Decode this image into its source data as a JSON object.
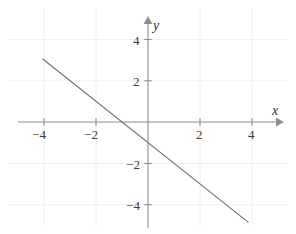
{
  "chart_data": {
    "type": "line",
    "title": "",
    "xlabel": "x",
    "ylabel": "y",
    "xlim": [
      -5.2,
      5.2
    ],
    "ylim": [
      -5.4,
      5.2
    ],
    "grid": true,
    "grid_style": "faint",
    "legend": "none",
    "background_color": "#ffffff",
    "axis_color": "#8c8c8c",
    "line_color": "#6f6f6f",
    "text_color": "#333333",
    "xticks": [
      -4,
      -2,
      2,
      4
    ],
    "yticks": [
      4,
      2,
      -2,
      -4
    ],
    "xtick_labels": [
      "-4",
      "-2",
      "2",
      "4"
    ],
    "ytick_labels": [
      "4",
      "2",
      "-2",
      "-4"
    ],
    "series": [
      {
        "name": "y = -x - 1",
        "slope": -1,
        "intercept": -1,
        "x_intercept": -1,
        "y_intercept": -1,
        "x": [
          -4.05,
          3.85
        ],
        "y": [
          3.05,
          -4.85
        ],
        "points": [
          {
            "x": -4.05,
            "y": 3.05
          },
          {
            "x": -1.0,
            "y": 0.0
          },
          {
            "x": 0.0,
            "y": -1.0
          },
          {
            "x": 3.85,
            "y": -4.85
          }
        ]
      }
    ],
    "axis_arrows": [
      "x-positive",
      "y-positive"
    ]
  },
  "labels": {
    "x_axis_name": "x",
    "y_axis_name": "y",
    "x_neg4": "−4",
    "x_neg2": "−2",
    "x_pos2": "2",
    "x_pos4": "4",
    "y_pos4": "4",
    "y_pos2": "2",
    "y_neg2": "−2",
    "y_neg4": "−4"
  }
}
